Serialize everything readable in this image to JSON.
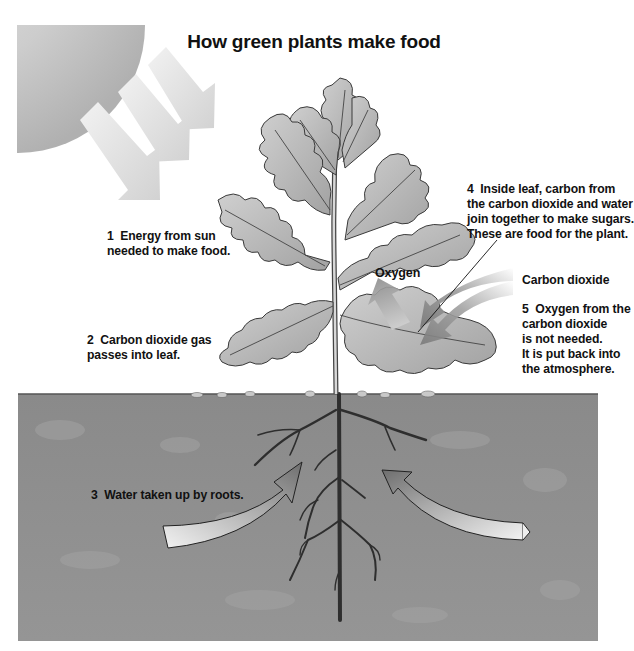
{
  "title": "How green plants make food",
  "labels": {
    "sun_energy": "1  Energy from sun\nneeded to make food.",
    "co2_gas": "2  Carbon dioxide gas\npasses into leaf.",
    "water_roots": "3  Water taken up by roots.",
    "inside_leaf": "4  Inside leaf, carbon from\nthe carbon dioxide and water\njoin together to make sugars.\nThese are food for the plant.",
    "oxygen": "Oxygen",
    "carbon_dioxide": "Carbon dioxide",
    "oxygen_released": "5  Oxygen from the\ncarbon dioxide\nis not needed.\nIt is put back into\nthe atmosphere."
  },
  "illustration": {
    "elements": [
      "sun-icon",
      "sunray-arrows",
      "plant",
      "leaf-arrows",
      "soil",
      "roots",
      "water-arrows"
    ],
    "colors": {
      "sun": "#c8c8c8",
      "soil": "#8e8e8e",
      "leaf": "#b4b4b4",
      "leaf_outline": "#3a3a3a",
      "arrow_light": "#e8e8e8",
      "arrow_dark": "#7a7a7a"
    }
  }
}
